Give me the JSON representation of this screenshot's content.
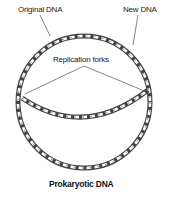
{
  "diagram": {
    "title": "Prokaryotic DNA",
    "labels": {
      "original": "Original DNA",
      "new": "New DNA",
      "forks": "Replication forks"
    }
  }
}
